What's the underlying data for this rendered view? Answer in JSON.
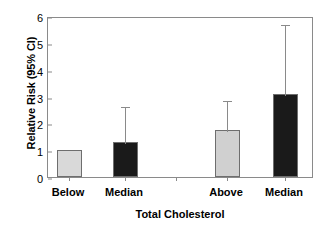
{
  "chart_data": {
    "type": "bar",
    "title": "",
    "xlabel": "Total Cholesterol",
    "ylabel": "Relative Risk (95% CI)",
    "ylim": [
      0,
      6
    ],
    "yticks": [
      0,
      1,
      2,
      3,
      4,
      5,
      6
    ],
    "ytick_labels": [
      "0",
      "1",
      "2",
      "3",
      "4",
      "5",
      "6"
    ],
    "grid": false,
    "legend": "none",
    "categories": [
      "Below",
      "Median",
      "Above",
      "Median"
    ],
    "values": [
      1.0,
      1.3,
      1.75,
      3.1
    ],
    "error_high": [
      null,
      2.7,
      2.9,
      5.75
    ],
    "error_low": [
      null,
      null,
      null,
      null
    ],
    "bar_colors": [
      "#d9d9d9",
      "#1a1a1a",
      "#d0d0d0",
      "#1a1a1a"
    ],
    "bar_edge_color": "#6e6e6e",
    "errorbar_color": "#8a8a8a",
    "axis_color": "#8a8a8a",
    "series": [
      {
        "name": "Relative Risk",
        "values": [
          1.0,
          1.3,
          1.75,
          3.1
        ]
      }
    ]
  },
  "axes": {
    "y_title": "Relative Risk (95% CI)",
    "x_title": "Total Cholesterol"
  }
}
